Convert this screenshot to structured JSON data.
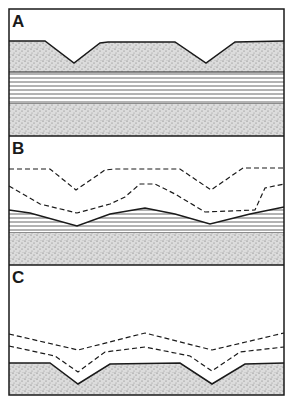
{
  "figure": {
    "panels": [
      {
        "label": "A",
        "description": "Stippled layer with two V-shaped valleys over horizontally laminated layer over stippled layer"
      },
      {
        "label": "B",
        "description": "Dashed former surfaces above wavy laminated layer over stippled layer"
      },
      {
        "label": "C",
        "description": "Dashed former surfaces above stippled layer with two V-shaped valleys"
      }
    ],
    "colors": {
      "line": "#1a1a1a",
      "stipple_bg": "#d8d8d8",
      "paper": "#ffffff"
    }
  }
}
